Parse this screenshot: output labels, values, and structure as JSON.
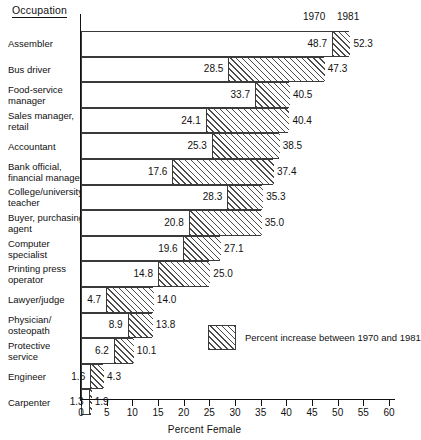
{
  "header": {
    "occupation_label": "Occupation",
    "year_left": "1970",
    "year_right": "1981"
  },
  "legend": {
    "text": "Percent increase between 1970 and 1981",
    "swatch_name": "hatched-increase-swatch"
  },
  "axis": {
    "xlabel": "Percent Female",
    "ticks": [
      "0",
      "5",
      "10",
      "15",
      "20",
      "25",
      "30",
      "35",
      "40",
      "45",
      "50",
      "55",
      "60"
    ]
  },
  "colors": {
    "line": "#3a3a3a",
    "text": "#111111",
    "hatch": "#4a4a4a",
    "bar_fill": "#ffffff"
  },
  "chart_data": {
    "type": "bar",
    "title": "",
    "subtitle": "",
    "xlabel": "Percent Female",
    "ylabel": "Occupation",
    "xlim": [
      0,
      60
    ],
    "grid": false,
    "orientation": "horizontal",
    "legend_position": "inside-lower-right",
    "annotations": [
      "1970",
      "1981",
      "Percent increase between 1970 and 1981"
    ],
    "categories": [
      "Assembler",
      "Bus driver",
      "Food-service\nmanager",
      "Sales manager,\nretail",
      "Accountant",
      "Bank official,\nfinancial manager",
      "College/university\nteacher",
      "Buyer, purchasing\nagent",
      "Computer\nspecialist",
      "Printing press\noperator",
      "Lawyer/judge",
      "Physician/\nosteopath",
      "Protective\nservice",
      "Engineer",
      "Carpenter"
    ],
    "series": [
      {
        "name": "1970",
        "values": [
          48.7,
          28.5,
          33.7,
          24.1,
          25.3,
          17.6,
          28.3,
          20.8,
          19.6,
          14.8,
          4.7,
          8.9,
          6.2,
          1.6,
          1.3
        ]
      },
      {
        "name": "1981",
        "values": [
          52.3,
          47.3,
          40.5,
          40.4,
          38.5,
          37.4,
          35.3,
          35.0,
          27.1,
          25.0,
          14.0,
          13.8,
          10.1,
          4.3,
          1.9
        ]
      }
    ],
    "rows": [
      {
        "label": "Assembler",
        "v1970": "48.7",
        "v1981": "52.3",
        "n1970": 48.7,
        "n1981": 52.3
      },
      {
        "label": "Bus driver",
        "v1970": "28.5",
        "v1981": "47.3",
        "n1970": 28.5,
        "n1981": 47.3
      },
      {
        "label": "Food-service\nmanager",
        "v1970": "33.7",
        "v1981": "40.5",
        "n1970": 33.7,
        "n1981": 40.5
      },
      {
        "label": "Sales manager,\nretail",
        "v1970": "24.1",
        "v1981": "40.4",
        "n1970": 24.1,
        "n1981": 40.4
      },
      {
        "label": "Accountant",
        "v1970": "25.3",
        "v1981": "38.5",
        "n1970": 25.3,
        "n1981": 38.5
      },
      {
        "label": "Bank official,\nfinancial manager",
        "v1970": "17.6",
        "v1981": "37.4",
        "n1970": 17.6,
        "n1981": 37.4
      },
      {
        "label": "College/university\nteacher",
        "v1970": "28.3",
        "v1981": "35.3",
        "n1970": 28.3,
        "n1981": 35.3
      },
      {
        "label": "Buyer, purchasing\nagent",
        "v1970": "20.8",
        "v1981": "35.0",
        "n1970": 20.8,
        "n1981": 35.0
      },
      {
        "label": "Computer\nspecialist",
        "v1970": "19.6",
        "v1981": "27.1",
        "n1970": 19.6,
        "n1981": 27.1
      },
      {
        "label": "Printing press\noperator",
        "v1970": "14.8",
        "v1981": "25.0",
        "n1970": 14.8,
        "n1981": 25.0
      },
      {
        "label": "Lawyer/judge",
        "v1970": "4.7",
        "v1981": "14.0",
        "n1970": 4.7,
        "n1981": 14.0
      },
      {
        "label": "Physician/\nosteopath",
        "v1970": "8.9",
        "v1981": "13.8",
        "n1970": 8.9,
        "n1981": 13.8
      },
      {
        "label": "Protective\nservice",
        "v1970": "6.2",
        "v1981": "10.1",
        "n1970": 6.2,
        "n1981": 10.1
      },
      {
        "label": "Engineer",
        "v1970": "1.6",
        "v1981": "4.3",
        "n1970": 1.6,
        "n1981": 4.3
      },
      {
        "label": "Carpenter",
        "v1970": "1.3",
        "v1981": "1.9",
        "n1970": 1.3,
        "n1981": 1.9
      }
    ]
  }
}
